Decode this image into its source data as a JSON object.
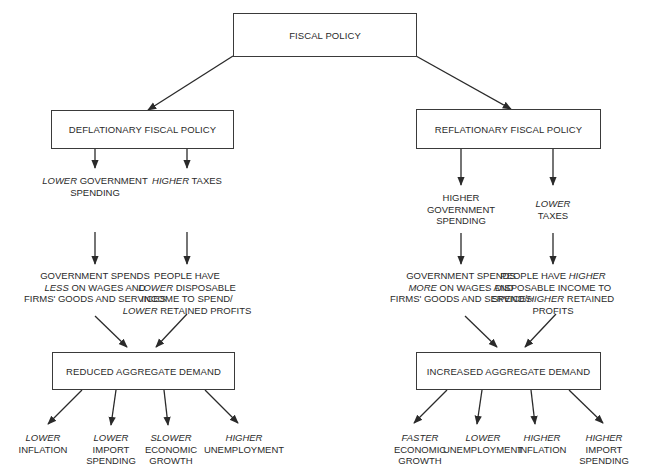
{
  "diagram": {
    "root": {
      "label": "FISCAL POLICY"
    },
    "branches": [
      {
        "id": "deflationary",
        "label": "DEFLATIONARY FISCAL POLICY",
        "instruments": [
          {
            "lines": [
              [
                {
                  "t": "LOWER",
                  "i": true
                },
                {
                  "t": " GOVERNMENT"
                }
              ],
              [
                {
                  "t": "SPENDING"
                }
              ]
            ]
          },
          {
            "lines": [
              [
                {
                  "t": "HIGHER",
                  "i": true
                },
                {
                  "t": " TAXES"
                }
              ]
            ]
          }
        ],
        "effects": [
          {
            "lines": [
              [
                {
                  "t": "GOVERNMENT SPENDS"
                }
              ],
              [
                {
                  "t": "LESS",
                  "i": true
                },
                {
                  "t": " ON WAGES AND"
                }
              ],
              [
                {
                  "t": "FIRMS' GOODS AND SERVICES"
                }
              ]
            ]
          },
          {
            "lines": [
              [
                {
                  "t": "PEOPLE HAVE"
                }
              ],
              [
                {
                  "t": "LOWER",
                  "i": true
                },
                {
                  "t": " DISPOSABLE"
                }
              ],
              [
                {
                  "t": "INCOME TO SPEND/"
                }
              ],
              [
                {
                  "t": "LOWER",
                  "i": true
                },
                {
                  "t": " RETAINED PROFITS"
                }
              ]
            ]
          }
        ],
        "demand": {
          "label": "REDUCED AGGREGATE DEMAND"
        },
        "outcomes": [
          {
            "lines": [
              [
                {
                  "t": "LOWER",
                  "i": true
                }
              ],
              [
                {
                  "t": "INFLATION"
                }
              ]
            ]
          },
          {
            "lines": [
              [
                {
                  "t": "LOWER",
                  "i": true
                }
              ],
              [
                {
                  "t": "IMPORT"
                }
              ],
              [
                {
                  "t": "SPENDING"
                }
              ]
            ]
          },
          {
            "lines": [
              [
                {
                  "t": "SLOWER",
                  "i": true
                }
              ],
              [
                {
                  "t": "ECONOMIC"
                }
              ],
              [
                {
                  "t": "GROWTH"
                }
              ]
            ]
          },
          {
            "lines": [
              [
                {
                  "t": "HIGHER",
                  "i": true
                }
              ],
              [
                {
                  "t": "UNEMPLOYMENT"
                }
              ]
            ]
          }
        ]
      },
      {
        "id": "reflationary",
        "label": "REFLATIONARY FISCAL POLICY",
        "instruments": [
          {
            "lines": [
              [
                {
                  "t": "HIGHER"
                }
              ],
              [
                {
                  "t": "GOVERNMENT"
                }
              ],
              [
                {
                  "t": "SPENDING"
                }
              ]
            ]
          },
          {
            "lines": [
              [
                {
                  "t": "LOWER",
                  "i": true
                }
              ],
              [
                {
                  "t": "TAXES"
                }
              ]
            ]
          }
        ],
        "effects": [
          {
            "lines": [
              [
                {
                  "t": "GOVERNMENT SPENDS"
                }
              ],
              [
                {
                  "t": "MORE",
                  "i": true
                },
                {
                  "t": " ON WAGES AND"
                }
              ],
              [
                {
                  "t": "FIRMS' GOODS AND SERVICES"
                }
              ]
            ]
          },
          {
            "lines": [
              [
                {
                  "t": "PEOPLE HAVE "
                },
                {
                  "t": "HIGHER",
                  "i": true
                }
              ],
              [
                {
                  "t": "DISPOSABLE INCOME TO"
                }
              ],
              [
                {
                  "t": "SPEND/"
                },
                {
                  "t": "HIGHER",
                  "i": true
                },
                {
                  "t": " RETAINED"
                }
              ],
              [
                {
                  "t": "PROFITS"
                }
              ]
            ]
          }
        ],
        "demand": {
          "label": "INCREASED AGGREGATE DEMAND"
        },
        "outcomes": [
          {
            "lines": [
              [
                {
                  "t": "FASTER",
                  "i": true
                }
              ],
              [
                {
                  "t": "ECONOMIC"
                }
              ],
              [
                {
                  "t": "GROWTH"
                }
              ]
            ]
          },
          {
            "lines": [
              [
                {
                  "t": "LOWER",
                  "i": true
                }
              ],
              [
                {
                  "t": "UNEMPLOYMENT"
                }
              ]
            ]
          },
          {
            "lines": [
              [
                {
                  "t": "HIGHER",
                  "i": true
                }
              ],
              [
                {
                  "t": "INFLATION"
                }
              ]
            ]
          },
          {
            "lines": [
              [
                {
                  "t": "HIGHER",
                  "i": true
                }
              ],
              [
                {
                  "t": "IMPORT"
                }
              ],
              [
                {
                  "t": "SPENDING"
                }
              ]
            ]
          }
        ]
      }
    ]
  },
  "colors": {
    "ink": "#2a2a2a",
    "background": "#ffffff"
  }
}
